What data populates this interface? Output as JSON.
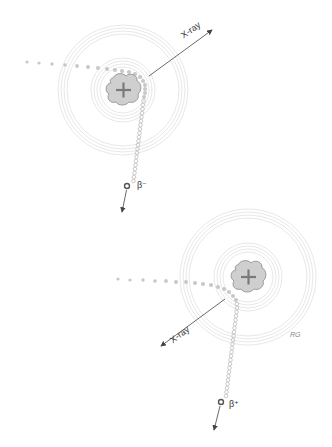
{
  "diagram": {
    "title": "",
    "colors": {
      "ring": "#d4d4d4",
      "nucleus_fill": "#cfcfcf",
      "nucleus_stroke": "#8a8a8a",
      "plus": "#7a7a7a",
      "trail_dot": "#c8c8c8",
      "arrow": "#444444",
      "particle": "#555555"
    },
    "panels": [
      {
        "name": "beta-minus-decay",
        "nucleus_symbol": "+",
        "xray_label": "X-ray",
        "particle_label": "β⁻",
        "xray_direction": "up-right",
        "particle_direction": "down"
      },
      {
        "name": "beta-plus-decay",
        "nucleus_symbol": "+",
        "xray_label": "X-ray",
        "particle_label": "β⁺",
        "xray_direction": "down-left",
        "particle_direction": "down",
        "signature": "RG"
      }
    ]
  }
}
